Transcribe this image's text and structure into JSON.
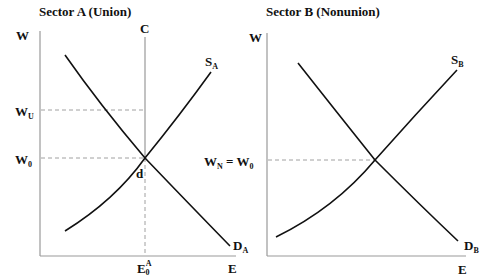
{
  "panels": [
    {
      "title": "Sector A (Union)",
      "y_axis_label": "W",
      "x_axis_label": "E",
      "wage_labels": {
        "upper": "W",
        "upper_sub": "U",
        "lower": "W",
        "lower_sub": "0"
      },
      "vertical_line_label": "C",
      "supply_label": "S",
      "supply_sub": "A",
      "demand_label": "D",
      "demand_sub": "A",
      "point_label": "d",
      "employment_label": "E",
      "employment_sup": "A",
      "employment_sub": "0"
    },
    {
      "title": "Sector B (Nonunion)",
      "y_axis_label": "W",
      "x_axis_label": "E",
      "wage_label": "W",
      "wage_sub": "N",
      "wage_eq": " = W",
      "wage_eq_sub": "0",
      "supply_label": "S",
      "supply_sub": "B",
      "demand_label": "D",
      "demand_sub": "B"
    }
  ],
  "colors": {
    "line": "#111111",
    "axis": "#999999",
    "dashed": "#888888"
  }
}
